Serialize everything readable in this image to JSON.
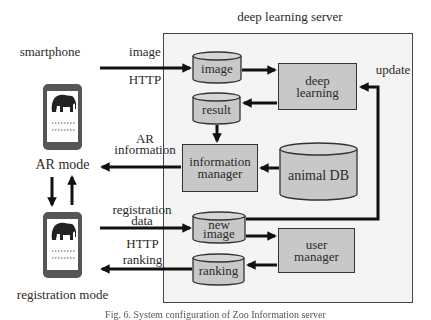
{
  "server": {
    "title": "deep learning server"
  },
  "client": {
    "smartphone_label": "smartphone",
    "ar_mode_label": "AR mode",
    "registration_mode_label": "registration mode"
  },
  "flows": {
    "image_label": "image",
    "http_top_label": "HTTP",
    "ar_information_line1": "AR",
    "ar_information_line2": "information",
    "registration_data_line1": "registration",
    "registration_data_line2": "data",
    "http_bottom_label": "HTTP",
    "ranking_label": "ranking",
    "update_label": "update"
  },
  "components": {
    "image_db": "image",
    "result_db": "result",
    "deep_learning_line1": "deep",
    "deep_learning_line2": "learning",
    "information_manager_line1": "information",
    "information_manager_line2": "manager",
    "animal_db": "animal DB",
    "new_image_line1": "new",
    "new_image_line2": "image",
    "user_manager_line1": "user",
    "user_manager_line2": "manager",
    "ranking_db": "ranking"
  },
  "caption": "Fig. 6. System configuration of Zoo Information server"
}
